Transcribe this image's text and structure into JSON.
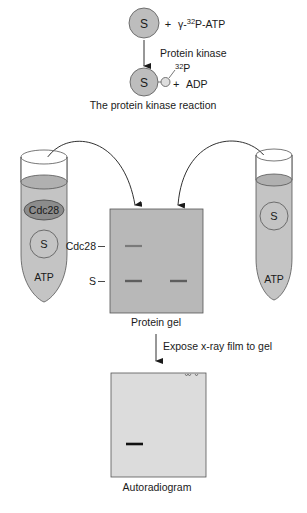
{
  "reaction": {
    "substrate_label": "S",
    "plus1": "+",
    "atp_label": "γ-32P-ATP",
    "atp_gamma": "γ-",
    "atp_super": "32",
    "atp_rest": "P-ATP",
    "enzyme_label": "Protein kinase",
    "product_super": "32",
    "product_p": "P",
    "plus2": "+",
    "adp_label": "ADP",
    "caption": "The protein kinase reaction"
  },
  "left_tube": {
    "contents": [
      "Cdc28",
      "S",
      "ATP"
    ]
  },
  "right_tube": {
    "contents": [
      "S",
      "ATP"
    ]
  },
  "gel": {
    "lane_labels": [
      "Cdc28",
      "S"
    ],
    "label_cdc28": "Cdc28",
    "label_s": "S",
    "caption": "Protein gel",
    "bands": [
      {
        "lane": 1,
        "protein": "Cdc28"
      },
      {
        "lane": 1,
        "protein": "S"
      },
      {
        "lane": 2,
        "protein": "S"
      }
    ]
  },
  "step": {
    "label": "Expose x-ray film to gel"
  },
  "autoradiogram": {
    "caption": "Autoradiogram",
    "bands": [
      {
        "lane": 1,
        "protein": "S (32P-labeled)"
      }
    ]
  },
  "colors": {
    "fill_gray": "#bdbdbd",
    "dark_gray": "#9a9a9a",
    "gel_gray": "#b8b8b8",
    "film_gray": "#dcdcdc",
    "band": "#6e6e6e",
    "band_dark": "#111111"
  }
}
